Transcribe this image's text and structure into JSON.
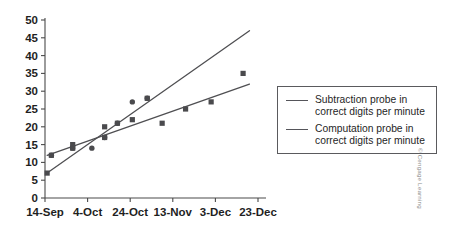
{
  "chart_data": {
    "type": "scatter",
    "title": "",
    "xlabel": "",
    "ylabel": "",
    "ylim": [
      0,
      50
    ],
    "ytick_labels": [
      "0",
      "5",
      "10",
      "15",
      "20",
      "25",
      "30",
      "35",
      "40",
      "45",
      "50"
    ],
    "ytick_values": [
      0,
      5,
      10,
      15,
      20,
      25,
      30,
      35,
      40,
      45,
      50
    ],
    "xtick_labels": [
      "14-Sep",
      "4-Oct",
      "24-Oct",
      "13-Nov",
      "3-Dec",
      "23-Dec"
    ],
    "xtick_values": [
      0,
      20,
      40,
      60,
      80,
      100
    ],
    "xlim": [
      0,
      100
    ],
    "grid": false,
    "legend_position": "right",
    "series": [
      {
        "name": "Subtraction probe in correct digits per minute",
        "marker": "circle",
        "color": "#4a4a4d",
        "points": [
          {
            "x": 3,
            "y": 12
          },
          {
            "x": 13,
            "y": 14
          },
          {
            "x": 22,
            "y": 14
          },
          {
            "x": 28,
            "y": 17
          },
          {
            "x": 34,
            "y": 21
          },
          {
            "x": 41,
            "y": 27
          },
          {
            "x": 48,
            "y": 28
          }
        ],
        "trend_line": {
          "x_start": 1,
          "y_start": 7,
          "x_end": 96,
          "y_end": 47
        }
      },
      {
        "name": "Computation probe in correct digits per minute",
        "marker": "square",
        "color": "#4a4a4d",
        "points": [
          {
            "x": 1,
            "y": 7
          },
          {
            "x": 3,
            "y": 12
          },
          {
            "x": 13,
            "y": 15
          },
          {
            "x": 13,
            "y": 14
          },
          {
            "x": 28,
            "y": 20
          },
          {
            "x": 28,
            "y": 17
          },
          {
            "x": 34,
            "y": 21
          },
          {
            "x": 41,
            "y": 22
          },
          {
            "x": 48,
            "y": 28
          },
          {
            "x": 55,
            "y": 21
          },
          {
            "x": 66,
            "y": 25
          },
          {
            "x": 78,
            "y": 27
          },
          {
            "x": 93,
            "y": 35
          }
        ],
        "trend_line": {
          "x_start": 1,
          "y_start": 12,
          "x_end": 96,
          "y_end": 32
        }
      }
    ]
  },
  "legend": {
    "entries": [
      {
        "label_line1": "Subtraction probe in",
        "label_line2": "correct digits per minute"
      },
      {
        "label_line1": "Computation probe in",
        "label_line2": "correct digits per minute"
      }
    ]
  },
  "footer": {
    "copyright": "© Cengage Learning"
  }
}
